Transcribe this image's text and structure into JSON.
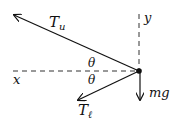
{
  "diagram": {
    "type": "free-body-diagram",
    "labels": {
      "upper_tension": "T",
      "upper_tension_sub": "u",
      "lower_tension": "T",
      "lower_tension_sub": "ℓ",
      "weight": "mg",
      "x_axis": "x",
      "y_axis": "y",
      "angle_upper": "θ",
      "angle_lower": "θ"
    },
    "colors": {
      "ink": "#111111",
      "background": "#ffffff"
    }
  }
}
